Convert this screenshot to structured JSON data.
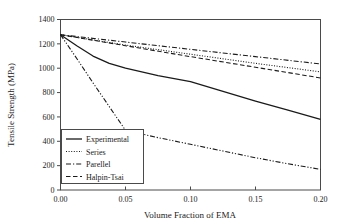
{
  "chart_data": {
    "type": "line",
    "title": "",
    "xlabel": "Volume Fraction of EMA",
    "ylabel": "Tensile Strength (MPa)",
    "xlim": [
      0.0,
      0.2
    ],
    "ylim": [
      0,
      1400
    ],
    "xticks": [
      0.0,
      0.05,
      0.1,
      0.15,
      0.2
    ],
    "xtick_labels": [
      "0.00",
      "0.05",
      "0.10",
      "0.15",
      "0.20"
    ],
    "yticks": [
      0,
      200,
      400,
      600,
      800,
      1000,
      1200,
      1400
    ],
    "ytick_labels": [
      "0",
      "200",
      "400",
      "600",
      "800",
      "1000",
      "1200",
      "1400"
    ],
    "grid": false,
    "legend_position": "lower-left-inside",
    "series": [
      {
        "name": "Experimental",
        "style": "solid",
        "x": [
          0.0,
          0.0125,
          0.025,
          0.0375,
          0.05,
          0.075,
          0.1,
          0.125,
          0.15,
          0.175,
          0.2
        ],
        "values": [
          1275,
          1185,
          1100,
          1040,
          1000,
          940,
          890,
          810,
          730,
          655,
          580
        ]
      },
      {
        "name": "Series",
        "style": "dotted",
        "x": [
          0.0,
          0.05,
          0.1,
          0.15,
          0.2
        ],
        "values": [
          1275,
          1190,
          1115,
          1040,
          970
        ]
      },
      {
        "name": "Parellel",
        "style": "dashdot",
        "x": [
          0.0,
          0.05,
          0.1,
          0.15,
          0.2
        ],
        "values": [
          1275,
          1215,
          1155,
          1095,
          1035
        ]
      },
      {
        "name": "Halpin-Tsai",
        "style": "dashed",
        "x": [
          0.0,
          0.05,
          0.1,
          0.15,
          0.2
        ],
        "values": [
          1275,
          1185,
          1095,
          1008,
          920
        ]
      },
      {
        "name": "Series-lower-bound",
        "style": "dashdotdot",
        "x": [
          0.0,
          0.0125,
          0.025,
          0.0375,
          0.05,
          0.075,
          0.1,
          0.125,
          0.15,
          0.175,
          0.2
        ],
        "values": [
          1275,
          1080,
          880,
          685,
          490,
          430,
          375,
          320,
          265,
          215,
          170
        ]
      }
    ],
    "legend_entries": [
      {
        "label": "Experimental",
        "style": "solid"
      },
      {
        "label": "Series",
        "style": "dotted"
      },
      {
        "label": "Parellel",
        "style": "dashdot"
      },
      {
        "label": "Halpin-Tsai",
        "style": "dashed"
      }
    ],
    "colors": {
      "line": "#1a1a1a",
      "axis": "#4a4a4a",
      "background": "#ffffff"
    }
  }
}
